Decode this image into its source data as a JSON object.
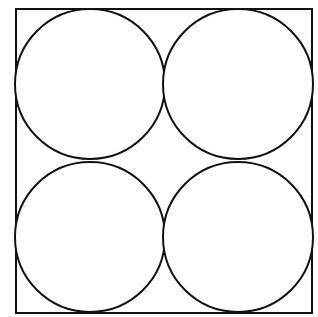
{
  "diagram": {
    "title": "",
    "stroke_color": "#111111",
    "background_color": "#ffffff",
    "stroke_width": 2,
    "square": {
      "x": 16,
      "y": 9,
      "width": 296,
      "height": 304
    },
    "circles": [
      {
        "id": "top-left",
        "cx": 90,
        "cy": 84,
        "r": 75
      },
      {
        "id": "top-right",
        "cx": 238,
        "cy": 84,
        "r": 75
      },
      {
        "id": "bottom-left",
        "cx": 90,
        "cy": 237,
        "r": 75
      },
      {
        "id": "bottom-right",
        "cx": 238,
        "cy": 237,
        "r": 75
      }
    ]
  }
}
